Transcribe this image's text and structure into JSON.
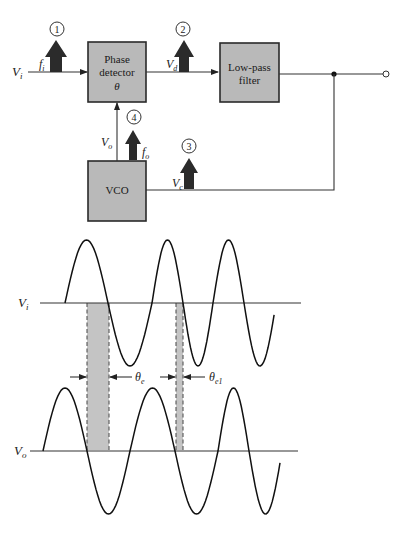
{
  "block_diagram": {
    "blocks": {
      "phase_detector": {
        "line1": "Phase",
        "line2": "detector",
        "line3": "θ"
      },
      "low_pass_filter": {
        "line1": "Low-pass",
        "line2": "filter"
      },
      "vco": {
        "label": "VCO"
      }
    },
    "signals": {
      "input": {
        "main": "V",
        "sub": "i"
      },
      "detector_output": {
        "main": "V",
        "sub": "d"
      },
      "control": {
        "main": "V",
        "sub": "c"
      },
      "vco_output": {
        "main": "V",
        "sub": "o"
      }
    },
    "frequency_labels": {
      "input_freq": {
        "main": "f",
        "sub": "i"
      },
      "output_freq": {
        "main": "f",
        "sub": "o"
      }
    },
    "measurement_points": [
      "1",
      "2",
      "3",
      "4"
    ]
  },
  "waveforms": {
    "input_wave": {
      "main": "V",
      "sub": "i"
    },
    "output_wave": {
      "main": "V",
      "sub": "o"
    },
    "phase_error": {
      "main": "θ",
      "sub": "e"
    },
    "phase_error_1": {
      "main": "θ",
      "sub": "e1"
    }
  }
}
